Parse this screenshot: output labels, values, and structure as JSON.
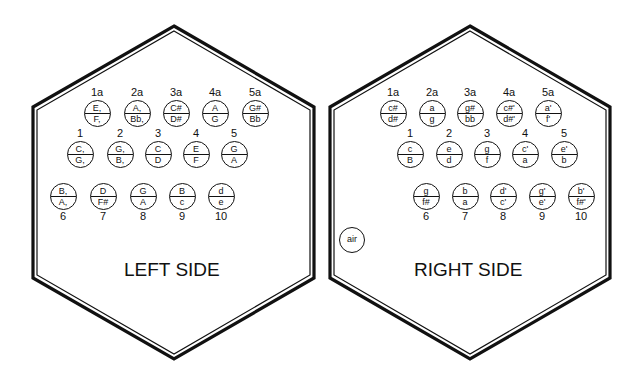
{
  "left": {
    "title": "LEFT SIDE",
    "rows": [
      {
        "y": 113,
        "label_pos": "above",
        "buttons": [
          {
            "id": "1a",
            "x": 97,
            "push": "E,",
            "pull": "F,"
          },
          {
            "id": "2a",
            "x": 137,
            "push": "A,",
            "pull": "Bb,"
          },
          {
            "id": "3a",
            "x": 176,
            "push": "C#",
            "pull": "D#"
          },
          {
            "id": "4a",
            "x": 215,
            "push": "A",
            "pull": "G"
          },
          {
            "id": "5a",
            "x": 255,
            "push": "G#",
            "pull": "Bb"
          }
        ]
      },
      {
        "y": 154,
        "label_pos": "above",
        "buttons": [
          {
            "id": "1",
            "x": 80,
            "push": "C,",
            "pull": "G,"
          },
          {
            "id": "2",
            "x": 120,
            "push": "G,",
            "pull": "B,"
          },
          {
            "id": "3",
            "x": 158,
            "push": "C",
            "pull": "D"
          },
          {
            "id": "4",
            "x": 196,
            "push": "E",
            "pull": "F"
          },
          {
            "id": "5",
            "x": 234,
            "push": "G",
            "pull": "A"
          }
        ]
      },
      {
        "y": 196,
        "label_pos": "below",
        "buttons": [
          {
            "id": "6",
            "x": 63,
            "push": "B,",
            "pull": "A,"
          },
          {
            "id": "7",
            "x": 103,
            "push": "D",
            "pull": "F#"
          },
          {
            "id": "8",
            "x": 143,
            "push": "G",
            "pull": "A"
          },
          {
            "id": "9",
            "x": 182,
            "push": "B",
            "pull": "c"
          },
          {
            "id": "10",
            "x": 221,
            "push": "d",
            "pull": "e"
          }
        ]
      }
    ]
  },
  "right": {
    "title": "RIGHT SIDE",
    "air_label": "air",
    "rows": [
      {
        "y": 113,
        "label_pos": "above",
        "buttons": [
          {
            "id": "1a",
            "x": 393,
            "push": "c#",
            "pull": "d#"
          },
          {
            "id": "2a",
            "x": 432,
            "push": "a",
            "pull": "g"
          },
          {
            "id": "3a",
            "x": 470,
            "push": "g#",
            "pull": "bb"
          },
          {
            "id": "4a",
            "x": 509,
            "push": "c#'",
            "pull": "d#'"
          },
          {
            "id": "5a",
            "x": 548,
            "push": "a'",
            "pull": "f'"
          }
        ]
      },
      {
        "y": 154,
        "label_pos": "above",
        "buttons": [
          {
            "id": "1",
            "x": 410,
            "push": "c",
            "pull": "B"
          },
          {
            "id": "2",
            "x": 449,
            "push": "e",
            "pull": "d"
          },
          {
            "id": "3",
            "x": 487,
            "push": "g",
            "pull": "f"
          },
          {
            "id": "4",
            "x": 525,
            "push": "c'",
            "pull": "a"
          },
          {
            "id": "5",
            "x": 564,
            "push": "e'",
            "pull": "b"
          }
        ]
      },
      {
        "y": 196,
        "label_pos": "below",
        "buttons": [
          {
            "id": "6",
            "x": 426,
            "push": "g",
            "pull": "f#"
          },
          {
            "id": "7",
            "x": 465,
            "push": "b",
            "pull": "a"
          },
          {
            "id": "8",
            "x": 503,
            "push": "d'",
            "pull": "c'"
          },
          {
            "id": "9",
            "x": 542,
            "push": "g'",
            "pull": "e'"
          },
          {
            "id": "10",
            "x": 581,
            "push": "b'",
            "pull": "f#'"
          }
        ]
      }
    ]
  }
}
